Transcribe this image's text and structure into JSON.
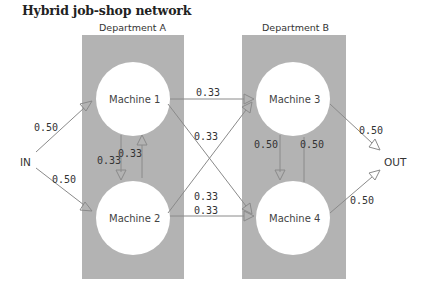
{
  "title": "Hybrid job-shop network",
  "colors": {
    "department_fill": "#b3b3b3",
    "machine_fill": "#ffffff",
    "arrow": "#8a8a8a",
    "text": "#333333"
  },
  "departments": [
    {
      "id": "A",
      "label": "Department A"
    },
    {
      "id": "B",
      "label": "Department B"
    }
  ],
  "machines": [
    {
      "id": "m1",
      "label": "Machine 1",
      "department": "A"
    },
    {
      "id": "m2",
      "label": "Machine 2",
      "department": "A"
    },
    {
      "id": "m3",
      "label": "Machine 3",
      "department": "B"
    },
    {
      "id": "m4",
      "label": "Machine 4",
      "department": "B"
    }
  ],
  "terminals": {
    "in": "IN",
    "out": "OUT"
  },
  "edges": [
    {
      "from": "IN",
      "to": "Machine 1",
      "prob": "0.50"
    },
    {
      "from": "IN",
      "to": "Machine 2",
      "prob": "0.50"
    },
    {
      "from": "Machine 1",
      "to": "Machine 2",
      "prob": "0.33"
    },
    {
      "from": "Machine 2",
      "to": "Machine 1",
      "prob": "0.33"
    },
    {
      "from": "Machine 1",
      "to": "Machine 3",
      "prob": "0.33"
    },
    {
      "from": "Machine 1",
      "to": "Machine 4",
      "prob": "0.33"
    },
    {
      "from": "Machine 2",
      "to": "Machine 3",
      "prob": "0.33"
    },
    {
      "from": "Machine 2",
      "to": "Machine 4",
      "prob": "0.33"
    },
    {
      "from": "Machine 3",
      "to": "Machine 4",
      "prob": "0.50"
    },
    {
      "from": "Machine 4",
      "to": "Machine 3",
      "prob": "0.50"
    },
    {
      "from": "Machine 3",
      "to": "OUT",
      "prob": "0.50"
    },
    {
      "from": "Machine 4",
      "to": "OUT",
      "prob": "0.50"
    }
  ]
}
